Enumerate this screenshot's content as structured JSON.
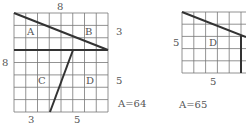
{
  "figure_left": {
    "top_label": "8",
    "left_label": "8",
    "right_top_label": "3",
    "right_bottom_label": "5",
    "bottom_left_label": "3",
    "bottom_right_label": "5",
    "regions": [
      "A",
      "B",
      "C",
      "D"
    ],
    "area_label": "A=64"
  },
  "figure_right": {
    "left_label": "5",
    "bottom_label": "5",
    "regions": [
      "D"
    ],
    "area_label": "A=65"
  },
  "colors": {
    "grid": "#666666",
    "cut": "#333333",
    "text": "#555555"
  }
}
